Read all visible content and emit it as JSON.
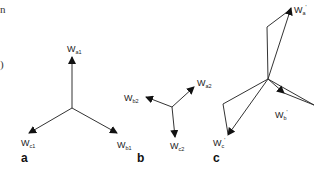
{
  "fragments": {
    "top_left": "n",
    "mid_left": ")"
  },
  "panels": [
    {
      "id": "a",
      "label": "a",
      "vectors": [
        {
          "name": "W",
          "sub": "a1",
          "prime": ""
        },
        {
          "name": "W",
          "sub": "b1",
          "prime": ""
        },
        {
          "name": "W",
          "sub": "c1",
          "prime": ""
        }
      ]
    },
    {
      "id": "b",
      "label": "b",
      "vectors": [
        {
          "name": "W",
          "sub": "a2",
          "prime": ""
        },
        {
          "name": "W",
          "sub": "b2",
          "prime": ""
        },
        {
          "name": "W",
          "sub": "c2",
          "prime": ""
        }
      ]
    },
    {
      "id": "c",
      "label": "c",
      "vectors": [
        {
          "name": "W",
          "sub": "a",
          "prime": "'"
        },
        {
          "name": "W",
          "sub": "b",
          "prime": "'"
        },
        {
          "name": "W",
          "sub": "c",
          "prime": "'"
        }
      ]
    }
  ],
  "colors": {
    "line": "#333333",
    "text": "#222222",
    "background": "#ffffff"
  }
}
